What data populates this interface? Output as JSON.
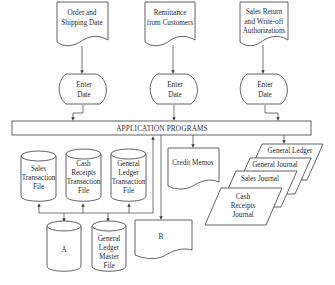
{
  "diagram": {
    "type": "flowchart",
    "inputs": [
      {
        "id": "doc1",
        "line1": "Order and",
        "line2": "Shipping Date",
        "line3": ""
      },
      {
        "id": "doc2",
        "line1": "Remittance",
        "line2": "from Customers",
        "line3": ""
      },
      {
        "id": "doc3",
        "line1": "Sales Return",
        "line2": "and Write-off",
        "line3": "Authorizations"
      }
    ],
    "manual_ops": [
      {
        "line1": "Enter",
        "line2": "Date"
      },
      {
        "line1": "Enter",
        "line2": "Date"
      },
      {
        "line1": "Enter",
        "line2": "Date"
      }
    ],
    "process": {
      "label": "APPLICATION PROGRAMS"
    },
    "transaction_files": [
      {
        "line1": "Sales",
        "line2": "Transaction",
        "line3": "File",
        "line4": ""
      },
      {
        "line1": "Cash",
        "line2": "Receipts",
        "line3": "Transaction",
        "line4": "File"
      },
      {
        "line1": "General",
        "line2": "Ledger",
        "line3": "Transaction",
        "line4": "File"
      }
    ],
    "master_files": [
      {
        "line1": "A",
        "line2": "",
        "line3": "",
        "line4": ""
      },
      {
        "line1": "General",
        "line2": "Ledger",
        "line3": "Master",
        "line4": "File"
      }
    ],
    "output_doc_b": {
      "label": "B"
    },
    "credit_memos": {
      "label": "Credit Memos"
    },
    "journals": [
      {
        "line1": "General Ledger"
      },
      {
        "line1": "General Journal"
      },
      {
        "line1": "Sales Journal"
      },
      {
        "line1": "Cash",
        "line2": "Receipts",
        "line3": "Journal"
      }
    ]
  }
}
